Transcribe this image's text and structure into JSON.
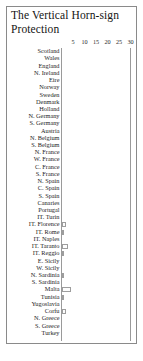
{
  "figure": {
    "title": "The Vertical Horn-sign Protection",
    "frame_color": "#8a8a8a",
    "bar_edge_color": "#9d9d9d",
    "bar_fill_color": "#fdfdfd"
  },
  "chart_data": {
    "type": "bar",
    "orientation": "horizontal",
    "title": "The Vertical Horn-sign Protection",
    "xlabel": "",
    "ylabel": "",
    "xlim": [
      0,
      30
    ],
    "ylim": null,
    "grid": false,
    "legend": null,
    "axis_position": "top",
    "ticks": [
      5,
      10,
      15,
      20,
      25,
      30
    ],
    "tick_labels": [
      "5",
      "10",
      "15",
      "20",
      "25",
      "30"
    ],
    "categories": [
      "Scotland",
      "Wales",
      "England",
      "N. Ireland",
      "Eire",
      "Norway",
      "Sweden",
      "Denmark",
      "Holland",
      "N. Germany",
      "S. Germany",
      "Austria",
      "N. Belgium",
      "S. Belgium",
      "N. France",
      "W. France",
      "C. France",
      "S. France",
      "N. Spain",
      "C. Spain",
      "S. Spain",
      "Canaries",
      "Portugal",
      "IT. Turin",
      "IT. Florence",
      "IT. Rome",
      "IT. Naples",
      "IT. Taranto",
      "IT. Reggio",
      "E. Sicily",
      "W. Sicily",
      "N. Sardinia",
      "S. Sardinia",
      "Malta",
      "Tunisia",
      "Yugoslavia",
      "Corfu",
      "N. Greece",
      "S. Greece",
      "Turkey"
    ],
    "values": [
      0,
      0,
      0,
      0,
      0,
      0,
      0,
      0,
      0,
      0,
      0,
      0,
      0,
      0,
      0,
      0,
      0,
      0,
      0,
      0,
      0,
      0,
      0,
      0,
      2,
      1,
      0,
      3,
      1,
      0,
      0,
      1,
      0,
      4,
      1,
      0,
      2,
      0,
      0,
      0
    ]
  }
}
